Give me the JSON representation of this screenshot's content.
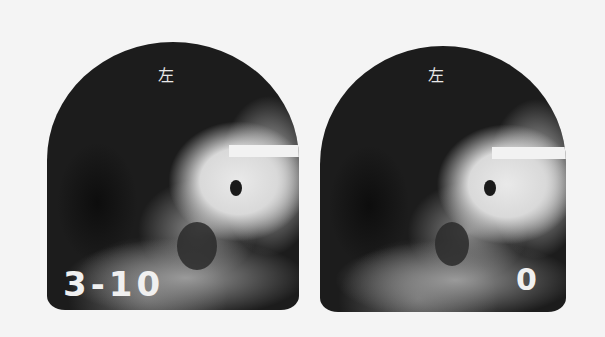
{
  "images": [
    {
      "id": "left",
      "label": "左",
      "id_text": "3-10"
    },
    {
      "id": "right",
      "label": "左",
      "id_text": "0"
    }
  ]
}
